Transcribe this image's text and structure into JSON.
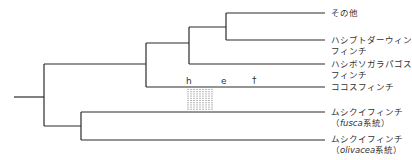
{
  "taxa": [
    {
      "id": "others",
      "line1": "その他",
      "line2": ""
    },
    {
      "id": "sharp-beaked",
      "line1": "ハシブトダーウィン",
      "line2": "フィンチ"
    },
    {
      "id": "slender-billed",
      "line1": "ハシボソガラパゴス",
      "line2": "フィンチ"
    },
    {
      "id": "cocos",
      "line1": "ココスフィンチ",
      "line2": ""
    },
    {
      "id": "warbler-fusca",
      "line1": "ムシクイフィンチ",
      "line2_pre": "（",
      "line2_italic": "fusca",
      "line2_post": "系統）"
    },
    {
      "id": "warbler-olivacea",
      "line1": "ムシクイフィンチ",
      "line2_pre": "（",
      "line2_italic": "olivacea",
      "line2_post": "系統）"
    }
  ],
  "markers": {
    "h": "h",
    "e": "e",
    "dagger": "†"
  },
  "colors": {
    "line": "#2b2b2b",
    "text": "#333333"
  }
}
